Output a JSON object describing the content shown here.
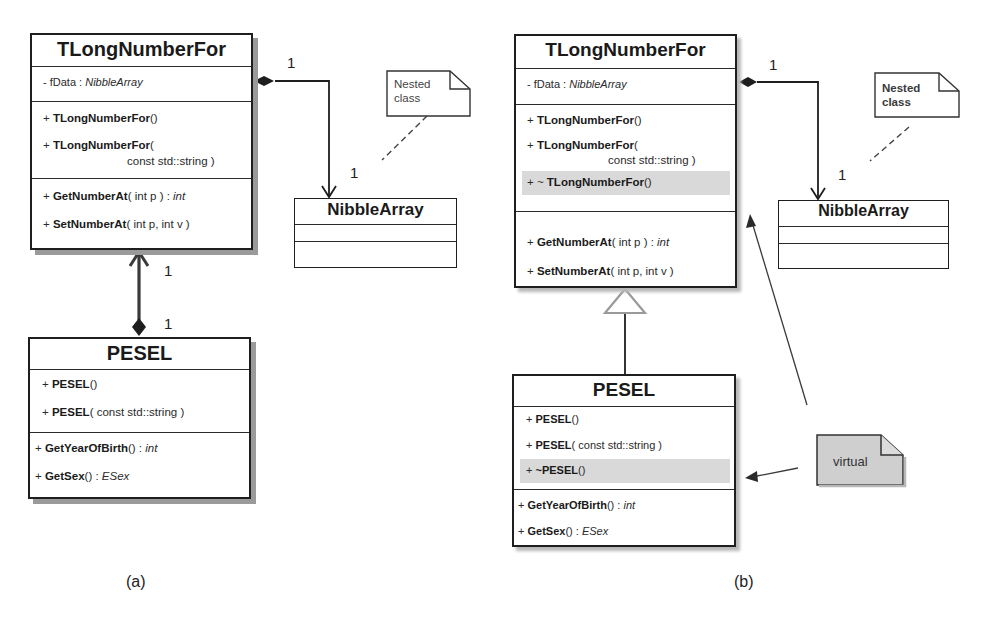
{
  "diagram_a": {
    "caption": "(a)",
    "tlong": {
      "name": "TLongNumberFor",
      "attribute": {
        "vis": "- fData : ",
        "type": "NibbleArray"
      },
      "ctor1": {
        "vis": "+ ",
        "name": "TLongNumberFor",
        "params": "()"
      },
      "ctor2": {
        "vis": "+ ",
        "name": "TLongNumberFor",
        "params": "(",
        "cont": "const std::string )"
      },
      "get": {
        "vis": "+ ",
        "name": "GetNumberAt",
        "params": "( int p ) : ",
        "ret": "int"
      },
      "set": {
        "vis": "+ ",
        "name": "SetNumberAt",
        "params": "( int p, int v )"
      }
    },
    "nibble": {
      "name": "NibbleArray"
    },
    "pesel": {
      "name": "PESEL",
      "ctor1": {
        "vis": "+ ",
        "name": "PESEL",
        "params": "()"
      },
      "ctor2": {
        "vis": "+ ",
        "name": "PESEL",
        "params": "( const std::string )"
      },
      "year": {
        "vis": "+ ",
        "name": "GetYearOfBirth",
        "params": "() : ",
        "ret": "int"
      },
      "sex": {
        "vis": "+ ",
        "name": "GetSex",
        "params": "() : ",
        "ret": "ESex"
      }
    },
    "note": {
      "line1": "Nested",
      "line2": "class"
    },
    "multiplicities": {
      "composition_source": "1",
      "composition_target": "1",
      "pesel_assoc_top": "1",
      "pesel_assoc_bottom": "1"
    }
  },
  "diagram_b": {
    "caption": "(b)",
    "tlong": {
      "name": "TLongNumberFor",
      "attribute": {
        "vis": "- fData : ",
        "type": "NibbleArray"
      },
      "ctor1": {
        "vis": "+ ",
        "name": "TLongNumberFor",
        "params": "()"
      },
      "ctor2": {
        "vis": "+ ",
        "name": "TLongNumberFor",
        "params": "(",
        "cont": "const std::string )"
      },
      "dtor": {
        "vis": "+ ~ ",
        "name": "TLongNumberFor",
        "params": "()"
      },
      "get": {
        "vis": "+ ",
        "name": "GetNumberAt",
        "params": "( int p ) : ",
        "ret": "int"
      },
      "set": {
        "vis": "+ ",
        "name": "SetNumberAt",
        "params": "( int p, int v )"
      }
    },
    "nibble": {
      "name": "NibbleArray"
    },
    "pesel": {
      "name": "PESEL",
      "ctor1": {
        "vis": "+ ",
        "name": "PESEL",
        "params": "()"
      },
      "ctor2": {
        "vis": "+ ",
        "name": "PESEL",
        "params": "( const std::string )"
      },
      "dtor": {
        "vis": "+ ",
        "name": "~PESEL",
        "params": "()"
      },
      "year": {
        "vis": "+ ",
        "name": "GetYearOfBirth",
        "params": "() : ",
        "ret": "int"
      },
      "sex": {
        "vis": "+ ",
        "name": "GetSex",
        "params": "() : ",
        "ret": "ESex"
      }
    },
    "note": {
      "line1": "Nested",
      "line2": "class"
    },
    "virtual_note": {
      "text": "virtual"
    },
    "multiplicities": {
      "composition_source": "1",
      "composition_target": "1"
    }
  },
  "colors": {
    "line": "#1e1e1e",
    "shadow": "#9a9a9a",
    "highlight": "#d9d9d9",
    "virtual_note_fill": "#cfcfcf"
  }
}
